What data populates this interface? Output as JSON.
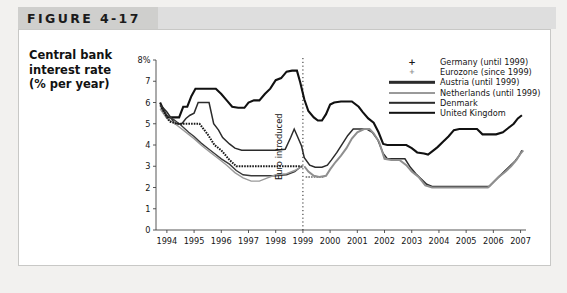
{
  "figure": {
    "tab_label": "FIGURE 4-17"
  },
  "axis_title": {
    "line1": "Central bank",
    "line2": "interest rate",
    "line3": "(% per year)"
  },
  "annotation": {
    "euro_introduced": "Euro introduced"
  },
  "legend": {
    "items": [
      {
        "label": "Germany (until 1999)",
        "marker": "plus-marker",
        "color": "#1a1a1a"
      },
      {
        "label": "Eurozone (since 1999)",
        "marker": "dot-marker",
        "color": "#8f8f8f"
      },
      {
        "label": "Austria (until 1999)",
        "marker": "line-swatch",
        "color": "#2b2b2b"
      },
      {
        "label": "Netherlands (until 1999)",
        "marker": "line-swatch",
        "color": "#9a9a9a"
      },
      {
        "label": "Denmark",
        "marker": "line-swatch",
        "color": "#2b2b2b"
      },
      {
        "label": "United Kingdom",
        "marker": "line-swatch",
        "color": "#111111"
      }
    ]
  },
  "chart_data": {
    "type": "line",
    "title": "FIGURE 4-17",
    "xlabel": "",
    "ylabel": "Central bank interest rate (% per year)",
    "xlim": [
      1993.6,
      2007.2
    ],
    "ylim": [
      0,
      8
    ],
    "yticks": [
      0,
      1,
      2,
      3,
      4,
      5,
      6,
      7,
      8
    ],
    "ytick_labels": [
      "0",
      "1",
      "2",
      "3",
      "4",
      "5",
      "6",
      "7",
      "8%"
    ],
    "xticks": [
      1994,
      1995,
      1996,
      1997,
      1998,
      1999,
      2000,
      2001,
      2002,
      2003,
      2004,
      2005,
      2006,
      2007
    ],
    "xtick_labels": [
      "1994",
      "1995",
      "1996",
      "1997",
      "1998",
      "1999",
      "2000",
      "2001",
      "2002",
      "2003",
      "2004",
      "2005",
      "2006",
      "2007"
    ],
    "grid": false,
    "legend_position": "top-right",
    "annotations": [
      {
        "text": "Euro introduced",
        "x": 1999.0,
        "type": "vertical-dotted-line"
      }
    ],
    "series": [
      {
        "name": "United Kingdom",
        "style": "solid",
        "width": 2.1,
        "color": "#111111",
        "points": [
          [
            1993.75,
            6.0
          ],
          [
            1994.0,
            5.3
          ],
          [
            1994.3,
            5.3
          ],
          [
            1994.45,
            5.3
          ],
          [
            1994.6,
            5.8
          ],
          [
            1994.75,
            5.8
          ],
          [
            1994.9,
            6.3
          ],
          [
            1995.05,
            6.65
          ],
          [
            1995.4,
            6.65
          ],
          [
            1995.8,
            6.65
          ],
          [
            1996.0,
            6.4
          ],
          [
            1996.2,
            6.1
          ],
          [
            1996.4,
            5.8
          ],
          [
            1996.62,
            5.75
          ],
          [
            1996.85,
            5.75
          ],
          [
            1997.0,
            6.0
          ],
          [
            1997.2,
            6.1
          ],
          [
            1997.4,
            6.1
          ],
          [
            1997.6,
            6.4
          ],
          [
            1997.8,
            6.65
          ],
          [
            1998.0,
            7.05
          ],
          [
            1998.2,
            7.15
          ],
          [
            1998.4,
            7.45
          ],
          [
            1998.6,
            7.5
          ],
          [
            1998.78,
            7.5
          ],
          [
            1998.9,
            6.95
          ],
          [
            1999.05,
            6.15
          ],
          [
            1999.2,
            5.6
          ],
          [
            1999.4,
            5.3
          ],
          [
            1999.55,
            5.15
          ],
          [
            1999.7,
            5.15
          ],
          [
            1999.85,
            5.45
          ],
          [
            2000.0,
            5.9
          ],
          [
            2000.15,
            6.0
          ],
          [
            2000.4,
            6.05
          ],
          [
            2000.8,
            6.05
          ],
          [
            2001.05,
            5.8
          ],
          [
            2001.2,
            5.55
          ],
          [
            2001.4,
            5.25
          ],
          [
            2001.6,
            5.05
          ],
          [
            2001.78,
            4.6
          ],
          [
            2001.95,
            4.05
          ],
          [
            2002.1,
            4.0
          ],
          [
            2002.4,
            4.0
          ],
          [
            2002.8,
            4.0
          ],
          [
            2003.0,
            3.85
          ],
          [
            2003.2,
            3.65
          ],
          [
            2003.45,
            3.6
          ],
          [
            2003.6,
            3.55
          ],
          [
            2003.8,
            3.75
          ],
          [
            2003.95,
            3.9
          ],
          [
            2004.15,
            4.15
          ],
          [
            2004.35,
            4.4
          ],
          [
            2004.55,
            4.7
          ],
          [
            2004.75,
            4.75
          ],
          [
            2005.0,
            4.75
          ],
          [
            2005.4,
            4.75
          ],
          [
            2005.6,
            4.5
          ],
          [
            2005.9,
            4.5
          ],
          [
            2006.1,
            4.5
          ],
          [
            2006.35,
            4.6
          ],
          [
            2006.55,
            4.8
          ],
          [
            2006.75,
            5.0
          ],
          [
            2006.9,
            5.25
          ],
          [
            2007.05,
            5.4
          ]
        ]
      },
      {
        "name": "Denmark",
        "style": "solid",
        "width": 1.5,
        "color": "#2b2b2b",
        "points": [
          [
            1993.75,
            5.9
          ],
          [
            1994.0,
            5.55
          ],
          [
            1994.3,
            5.0
          ],
          [
            1994.55,
            5.0
          ],
          [
            1994.7,
            5.25
          ],
          [
            1994.85,
            5.4
          ],
          [
            1995.0,
            5.5
          ],
          [
            1995.15,
            6.0
          ],
          [
            1995.35,
            6.0
          ],
          [
            1995.55,
            6.0
          ],
          [
            1995.72,
            5.0
          ],
          [
            1995.9,
            4.7
          ],
          [
            1996.05,
            4.35
          ],
          [
            1996.3,
            4.05
          ],
          [
            1996.5,
            3.85
          ],
          [
            1996.75,
            3.75
          ],
          [
            1997.0,
            3.75
          ],
          [
            1997.5,
            3.75
          ],
          [
            1998.0,
            3.75
          ],
          [
            1998.35,
            3.8
          ],
          [
            1998.55,
            4.35
          ],
          [
            1998.68,
            4.75
          ],
          [
            1998.8,
            4.4
          ],
          [
            1998.95,
            3.95
          ],
          [
            1999.05,
            3.4
          ],
          [
            1999.25,
            3.05
          ],
          [
            1999.45,
            2.95
          ],
          [
            1999.7,
            2.95
          ],
          [
            1999.9,
            3.05
          ],
          [
            2000.05,
            3.3
          ],
          [
            2000.25,
            3.65
          ],
          [
            2000.45,
            4.05
          ],
          [
            2000.65,
            4.45
          ],
          [
            2000.85,
            4.75
          ],
          [
            2001.1,
            4.75
          ],
          [
            2001.35,
            4.75
          ],
          [
            2001.55,
            4.6
          ],
          [
            2001.75,
            4.25
          ],
          [
            2001.95,
            3.6
          ],
          [
            2002.1,
            3.35
          ],
          [
            2002.4,
            3.35
          ],
          [
            2002.75,
            3.35
          ],
          [
            2002.95,
            2.95
          ],
          [
            2003.15,
            2.65
          ],
          [
            2003.35,
            2.4
          ],
          [
            2003.55,
            2.15
          ],
          [
            2003.75,
            2.05
          ],
          [
            2004.0,
            2.05
          ],
          [
            2004.5,
            2.05
          ],
          [
            2005.0,
            2.05
          ],
          [
            2005.5,
            2.05
          ],
          [
            2005.85,
            2.05
          ],
          [
            2006.0,
            2.25
          ],
          [
            2006.2,
            2.5
          ],
          [
            2006.4,
            2.75
          ],
          [
            2006.6,
            3.0
          ],
          [
            2006.8,
            3.25
          ],
          [
            2006.95,
            3.5
          ],
          [
            2007.05,
            3.75
          ]
        ]
      },
      {
        "name": "Austria (until 1999)",
        "style": "solid",
        "width": 1.4,
        "color": "#3a3a3a",
        "points": [
          [
            1993.75,
            5.85
          ],
          [
            1994.0,
            5.4
          ],
          [
            1994.25,
            5.2
          ],
          [
            1994.5,
            4.95
          ],
          [
            1994.8,
            4.6
          ],
          [
            1995.0,
            4.4
          ],
          [
            1995.25,
            4.1
          ],
          [
            1995.5,
            3.85
          ],
          [
            1995.75,
            3.6
          ],
          [
            1996.0,
            3.35
          ],
          [
            1996.3,
            3.1
          ],
          [
            1996.55,
            2.8
          ],
          [
            1996.8,
            2.6
          ],
          [
            1997.1,
            2.55
          ],
          [
            1997.5,
            2.55
          ],
          [
            1998.0,
            2.55
          ],
          [
            1998.4,
            2.6
          ],
          [
            1998.7,
            2.75
          ],
          [
            1998.9,
            2.95
          ],
          [
            1999.0,
            3.0
          ]
        ]
      },
      {
        "name": "Netherlands (until 1999)",
        "style": "solid",
        "width": 1.4,
        "color": "#9a9a9a",
        "points": [
          [
            1993.75,
            5.7
          ],
          [
            1994.0,
            5.25
          ],
          [
            1994.25,
            5.05
          ],
          [
            1994.5,
            4.8
          ],
          [
            1994.8,
            4.5
          ],
          [
            1995.0,
            4.3
          ],
          [
            1995.3,
            3.95
          ],
          [
            1995.6,
            3.65
          ],
          [
            1995.9,
            3.35
          ],
          [
            1996.2,
            3.05
          ],
          [
            1996.5,
            2.7
          ],
          [
            1996.8,
            2.45
          ],
          [
            1997.1,
            2.3
          ],
          [
            1997.4,
            2.3
          ],
          [
            1997.7,
            2.45
          ],
          [
            1998.0,
            2.6
          ],
          [
            1998.4,
            2.65
          ],
          [
            1998.7,
            2.8
          ],
          [
            1998.9,
            2.95
          ],
          [
            1999.0,
            3.0
          ]
        ]
      },
      {
        "name": "Germany (until 1999)",
        "style": "dotted-plus",
        "width": 2.0,
        "color": "#1a1a1a",
        "points": [
          [
            1993.8,
            5.75
          ],
          [
            1994.1,
            5.1
          ],
          [
            1994.4,
            5.0
          ],
          [
            1994.8,
            5.0
          ],
          [
            1995.2,
            5.0
          ],
          [
            1995.5,
            4.5
          ],
          [
            1995.75,
            4.0
          ],
          [
            1996.0,
            3.75
          ],
          [
            1996.3,
            3.3
          ],
          [
            1996.55,
            3.0
          ],
          [
            1996.9,
            3.0
          ],
          [
            1997.4,
            3.0
          ],
          [
            1997.9,
            3.0
          ],
          [
            1998.4,
            3.0
          ],
          [
            1998.7,
            3.0
          ],
          [
            1998.95,
            3.0
          ]
        ]
      },
      {
        "name": "Eurozone (since 1999)",
        "style": "dotted-plus",
        "width": 2.0,
        "color": "#8f8f8f",
        "points": [
          [
            1999.1,
            2.5
          ],
          [
            1999.35,
            2.5
          ],
          [
            1999.6,
            2.5
          ],
          [
            1999.8,
            2.5
          ]
        ]
      },
      {
        "name": "Eurozone main (since 1999)",
        "style": "solid-dotted",
        "width": 2.0,
        "color": "#8f8f8f",
        "points": [
          [
            1999.05,
            3.0
          ],
          [
            1999.2,
            2.75
          ],
          [
            1999.4,
            2.55
          ],
          [
            1999.6,
            2.5
          ],
          [
            1999.85,
            2.55
          ],
          [
            2000.0,
            2.85
          ],
          [
            2000.2,
            3.2
          ],
          [
            2000.4,
            3.5
          ],
          [
            2000.6,
            3.85
          ],
          [
            2000.8,
            4.3
          ],
          [
            2001.0,
            4.6
          ],
          [
            2001.25,
            4.75
          ],
          [
            2001.45,
            4.75
          ],
          [
            2001.6,
            4.55
          ],
          [
            2001.8,
            4.15
          ],
          [
            2002.0,
            3.35
          ],
          [
            2002.25,
            3.3
          ],
          [
            2002.55,
            3.3
          ],
          [
            2002.8,
            3.05
          ],
          [
            2003.0,
            2.75
          ],
          [
            2003.25,
            2.5
          ],
          [
            2003.5,
            2.1
          ],
          [
            2003.75,
            2.0
          ],
          [
            2004.0,
            2.0
          ],
          [
            2004.5,
            2.0
          ],
          [
            2005.0,
            2.0
          ],
          [
            2005.5,
            2.0
          ],
          [
            2005.8,
            2.0
          ],
          [
            2006.0,
            2.25
          ],
          [
            2006.2,
            2.5
          ],
          [
            2006.45,
            2.75
          ],
          [
            2006.65,
            3.0
          ],
          [
            2006.85,
            3.3
          ],
          [
            2007.0,
            3.6
          ],
          [
            2007.1,
            3.75
          ]
        ]
      }
    ]
  }
}
